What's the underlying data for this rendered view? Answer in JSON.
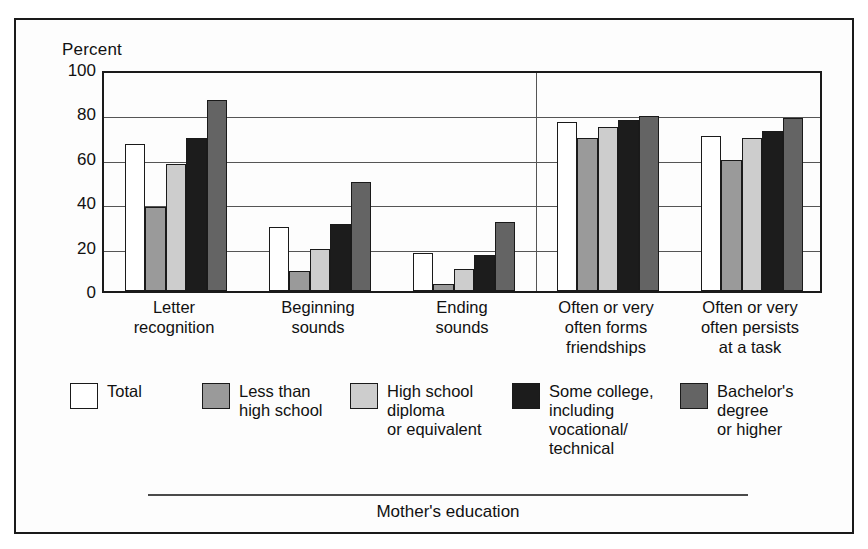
{
  "figure": {
    "axis_title": "Percent",
    "footer_axis_label": "Mother's education"
  },
  "chart_data": {
    "type": "bar",
    "title": "",
    "subtitle": "",
    "xlabel": "Mother's education",
    "ylabel": "Percent",
    "ylim": [
      0,
      100
    ],
    "yticks": [
      0,
      20,
      40,
      60,
      80,
      100
    ],
    "grid": true,
    "legend_position": "bottom",
    "categories": [
      "Letter\nrecognition",
      "Beginning\nsounds",
      "Ending\nsounds",
      "Often or very\noften forms\nfriendships",
      "Often or very\noften persists\nat a task"
    ],
    "series": [
      {
        "name": "Total",
        "color": "#ffffff",
        "values": [
          66,
          29,
          17,
          76,
          70
        ]
      },
      {
        "name": "Less than\nhigh school",
        "color": "#9a9a9a",
        "values": [
          38,
          9,
          3,
          69,
          59
        ]
      },
      {
        "name": "High school\ndiploma\nor equivalent",
        "color": "#cdcdcd",
        "values": [
          57,
          19,
          10,
          74,
          69
        ]
      },
      {
        "name": "Some college,\nincluding\nvocational/\ntechnical",
        "color": "#1c1c1c",
        "values": [
          69,
          30,
          16,
          77,
          72
        ]
      },
      {
        "name": "Bachelor's\ndegree\nor higher",
        "color": "#646464",
        "values": [
          86,
          49,
          31,
          79,
          78
        ]
      }
    ],
    "group_divider_after_category": 3,
    "annotations": []
  },
  "legend": [
    {
      "label": "Total",
      "color": "#ffffff"
    },
    {
      "label": "Less than\nhigh school",
      "color": "#9a9a9a"
    },
    {
      "label": "High school\ndiploma\nor equivalent",
      "color": "#cdcdcd"
    },
    {
      "label": "Some college,\nincluding\nvocational/\ntechnical",
      "color": "#1c1c1c"
    },
    {
      "label": "Bachelor's\ndegree\nor higher",
      "color": "#646464"
    }
  ]
}
